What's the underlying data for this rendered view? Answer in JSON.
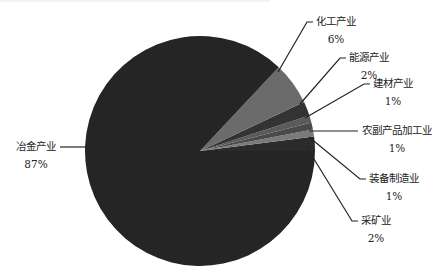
{
  "chart_data": {
    "type": "pie",
    "title": "",
    "start_angle_deg": 0,
    "direction": "counterclockwise",
    "slices": [
      {
        "label": "采矿业",
        "value": 2,
        "display": "2%",
        "color": "#2b2b2b"
      },
      {
        "label": "装备制造业",
        "value": 1,
        "display": "1%",
        "color": "#7a7a7a"
      },
      {
        "label": "农副产品加工业",
        "value": 1,
        "display": "1%",
        "color": "#4a4a4a"
      },
      {
        "label": "建材产业",
        "value": 1,
        "display": "1%",
        "color": "#5a5a5a"
      },
      {
        "label": "能源产业",
        "value": 2,
        "display": "2%",
        "color": "#333333"
      },
      {
        "label": "化工产业",
        "value": 6,
        "display": "6%",
        "color": "#6b6b6b"
      },
      {
        "label": "冶金产业",
        "value": 87,
        "display": "87%",
        "color": "#252525"
      }
    ],
    "legend": "none",
    "data_labels": "outside with leader lines"
  },
  "labels": {
    "mining": {
      "name": "采矿业",
      "pct": "2%"
    },
    "equipment": {
      "name": "装备制造业",
      "pct": "1%"
    },
    "agri": {
      "name": "农副产品加工业",
      "pct": "1%"
    },
    "building": {
      "name": "建材产业",
      "pct": "1%"
    },
    "energy": {
      "name": "能源产业",
      "pct": "2%"
    },
    "chemical": {
      "name": "化工产业",
      "pct": "6%"
    },
    "metallurgy": {
      "name": "冶金产业",
      "pct": "87%"
    }
  }
}
